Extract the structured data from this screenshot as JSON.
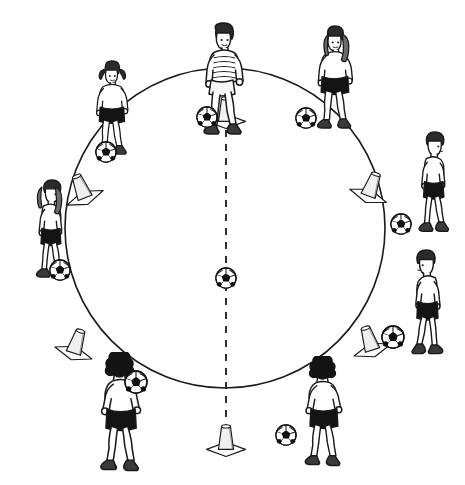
{
  "diagram": {
    "title": "Soccer circle dribbling drill",
    "background_color": "#ffffff",
    "line_color": "#1a1a1a",
    "skin_color": "#ffffff",
    "shirt_light_color": "#ffffff",
    "shorts_dark_color": "#141414",
    "hair_dark_color": "#1a1a1a",
    "ball_dark_color": "#111111",
    "cone_fill_color": "#f2f2f2"
  },
  "field": {
    "circle": {
      "label": "training-circle",
      "center_x": 225,
      "center_y": 228,
      "radius": 160,
      "stroke_width": 1.6,
      "style": "solid"
    },
    "divider_line": {
      "label": "center-dashed-line",
      "x": 226,
      "y_start": 74,
      "y_end": 444,
      "style": "dashed",
      "dash": "7 7",
      "stroke_width": 1.8
    },
    "center_ball": {
      "label": "center-soccer-ball",
      "x": 226,
      "y": 278,
      "radius": 11
    }
  },
  "cones": [
    {
      "name": "cone-top",
      "x": 226,
      "y": 113,
      "angle_deg": 90,
      "rotation": 0
    },
    {
      "name": "cone-upper-left",
      "x": 82,
      "y": 190,
      "angle_deg": 150,
      "rotation": -22
    },
    {
      "name": "cone-upper-right",
      "x": 371,
      "y": 188,
      "angle_deg": 30,
      "rotation": 20
    },
    {
      "name": "cone-lower-left",
      "x": 76,
      "y": 345,
      "angle_deg": 210,
      "rotation": 18
    },
    {
      "name": "cone-lower-right",
      "x": 370,
      "y": 342,
      "angle_deg": 330,
      "rotation": -18
    },
    {
      "name": "cone-bottom",
      "x": 226,
      "y": 441,
      "angle_deg": 270,
      "rotation": 0
    }
  ],
  "players": [
    {
      "name": "player-top-striped-shirt",
      "position_label": "top",
      "x": 186,
      "y": 22,
      "scale": 1.0,
      "facing": "front",
      "hair": "short-dark",
      "shirt": "striped-light",
      "shorts": "light",
      "ball": {
        "x": 207,
        "y": 117,
        "radius": 11
      }
    },
    {
      "name": "player-upper-left-pigtails",
      "position_label": "upper-left",
      "x": 80,
      "y": 60,
      "scale": 0.84,
      "facing": "front",
      "hair": "pigtails",
      "shirt": "light",
      "shorts": "dark",
      "ball": {
        "x": 106,
        "y": 152,
        "radius": 11
      }
    },
    {
      "name": "player-upper-right-long-hair",
      "position_label": "upper-right",
      "x": 300,
      "y": 25,
      "scale": 0.92,
      "facing": "front",
      "hair": "long",
      "shirt": "light",
      "shorts": "dark",
      "ball": {
        "x": 306,
        "y": 118,
        "radius": 11
      }
    },
    {
      "name": "player-left-ponytail",
      "position_label": "left",
      "x": 14,
      "y": 178,
      "scale": 0.9,
      "facing": "right",
      "hair": "ponytail",
      "shirt": "light",
      "shorts": "dark",
      "ball": {
        "x": 60,
        "y": 270,
        "radius": 11
      }
    },
    {
      "name": "player-right-walking",
      "position_label": "right",
      "x": 396,
      "y": 130,
      "scale": 0.92,
      "facing": "right",
      "hair": "short-dark",
      "shirt": "light",
      "shorts": "dark",
      "ball": {
        "x": 401,
        "y": 224,
        "radius": 11
      }
    },
    {
      "name": "player-lower-right-dribbling",
      "position_label": "lower-right",
      "x": 390,
      "y": 248,
      "scale": 0.96,
      "facing": "left",
      "hair": "short-dark",
      "shirt": "light",
      "shorts": "light",
      "ball": {
        "x": 393,
        "y": 337,
        "radius": 12
      }
    },
    {
      "name": "player-bottom-left-back-view",
      "position_label": "bottom-left",
      "x": 80,
      "y": 352,
      "scale": 1.04,
      "facing": "back",
      "hair": "curly-dark",
      "shirt": "light",
      "shorts": "dark",
      "ball": {
        "x": 136,
        "y": 382,
        "radius": 12
      }
    },
    {
      "name": "player-bottom-right-back-view",
      "position_label": "bottom-right",
      "x": 286,
      "y": 356,
      "scale": 0.96,
      "facing": "back",
      "hair": "curly-dark",
      "shirt": "light",
      "shorts": "dark",
      "ball": {
        "x": 286,
        "y": 435,
        "radius": 11
      }
    }
  ],
  "counts": {
    "players": 8,
    "cones": 6,
    "balls_total": 9
  }
}
